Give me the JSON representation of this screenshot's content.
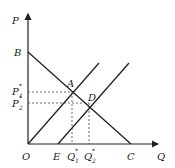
{
  "axes": {
    "y_label": "P",
    "x_label": "Q",
    "origin": "O"
  },
  "points": {
    "B": "B",
    "A": "A",
    "D": "D",
    "E": "E",
    "C": "C"
  },
  "price_labels": [
    {
      "base": "P",
      "sup": "*",
      "sub": "1"
    },
    {
      "base": "P",
      "sup": "*",
      "sub": "2"
    }
  ],
  "quantity_labels": [
    {
      "base": "Q",
      "sup": "*",
      "sub": "1"
    },
    {
      "base": "Q",
      "sup": "*",
      "sub": "2"
    }
  ],
  "colors": {
    "line": "#222222",
    "dash": "#444444"
  }
}
